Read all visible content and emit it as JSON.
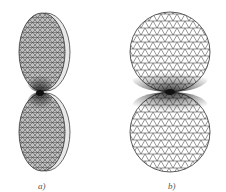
{
  "figures": [
    {
      "id": "a",
      "label": "a)",
      "description": "Two tilted disks touching at a point, shown in 3D perspective with finite-element triangular mesh",
      "mesh_color": "#333333",
      "surface_color": "#b8b8b8",
      "rim_color": "#e6e6e6"
    },
    {
      "id": "b",
      "label": "b)",
      "description": "Two disks (front view) touching at a point with refined triangular mesh near contact",
      "mesh_color": "#222222",
      "surface_color": "#ffffff"
    }
  ]
}
